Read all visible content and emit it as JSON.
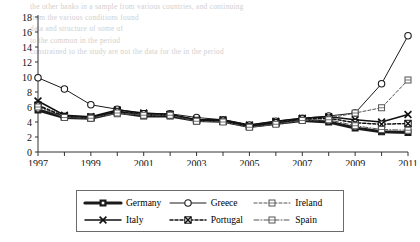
{
  "page": {
    "bleed_text": "the other banks in a sample from various countries, and continuing\nfrom the various conditions found\ndata and structure of some of\nto the common in the period\nconstrained to the study are not the data for the in the period"
  },
  "chart_data": {
    "type": "line",
    "title": "",
    "xlabel": "",
    "ylabel": "",
    "x": [
      1997,
      1998,
      1999,
      2000,
      2001,
      2002,
      2003,
      2004,
      2005,
      2006,
      2007,
      2008,
      2009,
      2010,
      2011
    ],
    "xlim": [
      1997,
      2011
    ],
    "ylim": [
      0,
      18
    ],
    "ytick_values": [
      0,
      2,
      4,
      6,
      8,
      10,
      12,
      14,
      16,
      18
    ],
    "xtick_labels": [
      "1997",
      "1999",
      "2001",
      "2003",
      "2005",
      "2007",
      "2009",
      "2011"
    ],
    "xtick_values": [
      1997,
      1999,
      2001,
      2003,
      2005,
      2007,
      2009,
      2011
    ],
    "grid": false,
    "legend_position": "bottom",
    "series": [
      {
        "name": "Germany",
        "color": "#1a1a1a",
        "marker": "filled-square",
        "dash": "solid",
        "width": 3.2,
        "values": [
          5.6,
          4.6,
          4.5,
          5.3,
          4.8,
          4.8,
          4.2,
          4.1,
          3.4,
          3.8,
          4.2,
          4.0,
          3.2,
          2.7,
          2.6
        ]
      },
      {
        "name": "Greece",
        "color": "#1a1a1a",
        "marker": "open-circle",
        "dash": "solid",
        "width": 1,
        "values": [
          9.9,
          8.4,
          6.3,
          5.7,
          5.1,
          5.1,
          4.6,
          4.3,
          3.6,
          4.1,
          4.5,
          4.8,
          5.2,
          9.1,
          15.5
        ]
      },
      {
        "name": "Ireland",
        "color": "#555555",
        "marker": "open-square",
        "dash": "dashed",
        "width": 1,
        "values": [
          6.3,
          4.8,
          4.7,
          5.1,
          5.0,
          5.0,
          4.1,
          4.1,
          3.4,
          3.8,
          4.3,
          4.5,
          5.2,
          5.9,
          9.6
        ]
      },
      {
        "name": "Italy",
        "color": "#111111",
        "marker": "x-cross",
        "dash": "solid",
        "width": 1.5,
        "values": [
          6.8,
          4.9,
          4.7,
          5.6,
          5.2,
          5.0,
          4.3,
          4.3,
          3.6,
          4.1,
          4.5,
          4.7,
          4.3,
          4.0,
          5.0
        ]
      },
      {
        "name": "Portugal",
        "color": "#111111",
        "marker": "x-box",
        "dash": "dashed",
        "width": 1.5,
        "values": [
          6.2,
          4.7,
          4.6,
          5.4,
          5.1,
          5.0,
          4.2,
          4.1,
          3.4,
          3.9,
          4.4,
          4.5,
          3.9,
          3.7,
          3.8
        ]
      },
      {
        "name": "Spain",
        "color": "#555555",
        "marker": "open-square",
        "dash": "dashdot",
        "width": 1,
        "values": [
          6.0,
          4.6,
          4.5,
          5.2,
          4.9,
          4.9,
          4.1,
          4.0,
          3.3,
          3.7,
          4.2,
          4.3,
          3.5,
          3.0,
          2.9
        ]
      }
    ]
  },
  "legend": {
    "items": [
      {
        "label": "Germany"
      },
      {
        "label": "Greece"
      },
      {
        "label": "Ireland"
      },
      {
        "label": "Italy"
      },
      {
        "label": "Portugal"
      },
      {
        "label": "Spain"
      }
    ]
  }
}
